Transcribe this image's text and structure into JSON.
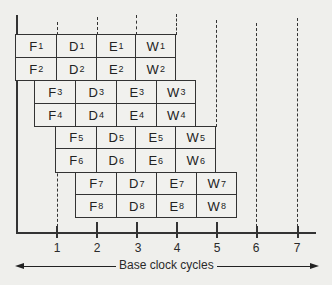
{
  "figure": {
    "type": "pipeline-timing-diagram",
    "x_axis": {
      "title": "Base clock cycles",
      "ticks": [
        "1",
        "2",
        "3",
        "4",
        "5",
        "6",
        "7"
      ]
    },
    "stages": [
      "F",
      "D",
      "E",
      "W"
    ],
    "rows": [
      {
        "instr": "1",
        "cells": [
          "F",
          "D",
          "E",
          "W"
        ],
        "start_cycle": 0
      },
      {
        "instr": "2",
        "cells": [
          "F",
          "D",
          "E",
          "W"
        ],
        "start_cycle": 0
      },
      {
        "instr": "3",
        "cells": [
          "F",
          "D",
          "E",
          "W"
        ],
        "start_cycle": 0.5
      },
      {
        "instr": "4",
        "cells": [
          "F",
          "D",
          "E",
          "W"
        ],
        "start_cycle": 0.5
      },
      {
        "instr": "5",
        "cells": [
          "F",
          "D",
          "E",
          "W"
        ],
        "start_cycle": 1
      },
      {
        "instr": "6",
        "cells": [
          "F",
          "D",
          "E",
          "W"
        ],
        "start_cycle": 1
      },
      {
        "instr": "7",
        "cells": [
          "F",
          "D",
          "E",
          "W"
        ],
        "start_cycle": 1.5
      },
      {
        "instr": "8",
        "cells": [
          "F",
          "D",
          "E",
          "W"
        ],
        "start_cycle": 1.5
      }
    ]
  }
}
